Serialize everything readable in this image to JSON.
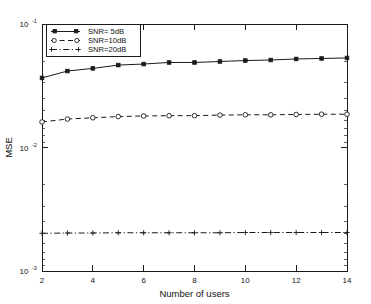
{
  "chart_data": {
    "type": "line",
    "title": "",
    "xlabel": "Number of users",
    "ylabel": "MSE",
    "xlim": [
      2,
      14
    ],
    "ylim": [
      0.001,
      0.1
    ],
    "yscale": "log",
    "xscale": "linear",
    "grid": false,
    "legend_position": "upper-left",
    "x": [
      2,
      3,
      4,
      5,
      6,
      7,
      8,
      9,
      10,
      11,
      12,
      13,
      14
    ],
    "xticks": [
      "2",
      "4",
      "6",
      "8",
      "10",
      "12",
      "14"
    ],
    "xtick_values": [
      2,
      4,
      6,
      8,
      10,
      12,
      14
    ],
    "yticks": [
      "10",
      "10",
      "10"
    ],
    "ytick_exponents": [
      "-1",
      "-2",
      "-3"
    ],
    "ytick_values": [
      0.1,
      0.01,
      0.001
    ],
    "series": [
      {
        "name": "SNR= 5dB",
        "marker": "filled-square",
        "linestyle": "solid",
        "values": [
          0.0366,
          0.0416,
          0.0437,
          0.0465,
          0.0474,
          0.0488,
          0.0488,
          0.0497,
          0.0506,
          0.0511,
          0.0521,
          0.0526,
          0.0531
        ]
      },
      {
        "name": "SNR=10dB",
        "marker": "open-circle",
        "linestyle": "dashed",
        "values": [
          0.0161,
          0.017,
          0.0174,
          0.0178,
          0.018,
          0.0181,
          0.0181,
          0.0183,
          0.0184,
          0.0184,
          0.0185,
          0.0186,
          0.0186
        ]
      },
      {
        "name": "SNR=20dB",
        "marker": "plus",
        "linestyle": "dash-dot",
        "values": [
          0.00202,
          0.00203,
          0.00203,
          0.00204,
          0.00204,
          0.00204,
          0.00204,
          0.00204,
          0.00205,
          0.00205,
          0.00205,
          0.00205,
          0.00205
        ]
      }
    ]
  },
  "legend": {
    "entries": [
      {
        "label": "SNR= 5dB"
      },
      {
        "label": "SNR=10dB"
      },
      {
        "label": "SNR=20dB"
      }
    ]
  },
  "axes": {
    "x_title": "Number of users",
    "y_title": "MSE",
    "y_base": "10",
    "y_exp_top": "-1",
    "y_exp_mid": "-2",
    "y_exp_bot": "-3"
  }
}
